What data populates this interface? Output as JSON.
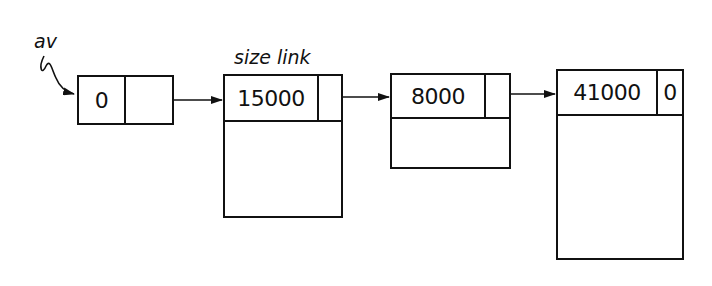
{
  "pointer": {
    "label": "av",
    "head_value": "0"
  },
  "field_labels": {
    "size_link": "size link"
  },
  "blocks": [
    {
      "size": "15000",
      "link": ""
    },
    {
      "size": "8000",
      "link": ""
    },
    {
      "size": "41000",
      "link": "0"
    }
  ],
  "colors": {
    "line": "#111111",
    "background": "#ffffff"
  }
}
